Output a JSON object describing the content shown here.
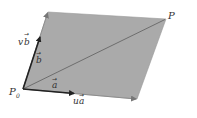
{
  "diagram": {
    "type": "parallelogram-vector-decomposition",
    "colors": {
      "fill": "#aaaaaa",
      "edge": "#222222",
      "diagonal": "#666666",
      "text": "#333333",
      "background": "#ffffff"
    },
    "points": {
      "P0": [
        23,
        89
      ],
      "ua_end": [
        137,
        99
      ],
      "vb_end": [
        48,
        12
      ],
      "P": [
        166,
        19
      ],
      "a_tip": [
        72,
        93
      ],
      "b_tip": [
        40,
        38
      ]
    },
    "labels": {
      "P": "P",
      "P0_base": "P",
      "P0_sub": "0",
      "a_vec": "a",
      "b_vec": "b",
      "ua_coef": "u",
      "ua_vec": "a",
      "vb_coef": "v",
      "vb_vec": "b"
    }
  }
}
